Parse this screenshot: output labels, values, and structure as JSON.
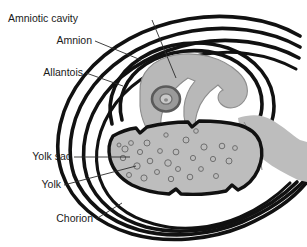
{
  "figure": {
    "background_color": "#ffffff",
    "line_color": "#111111",
    "tissue_fill": "#bdbdbd",
    "embryo_fill": "#b8b8b8",
    "granule_stroke": "#6f6f6f",
    "label_color": "#1a1a1a"
  },
  "labels": {
    "amniotic_cavity": "Amniotic cavity",
    "amnion": "Amnion",
    "allantois": "Allantois",
    "yolk_sac": "Yolk sac",
    "yolk": "Yolk",
    "chorion": "Chorion"
  },
  "structures": {
    "embryo": "embryo",
    "eye": "embryo-eye",
    "yolk_mass": "yolk-mass",
    "allantois_lobe": "allantois-lobe",
    "shell_membranes": "concentric-membranes"
  }
}
